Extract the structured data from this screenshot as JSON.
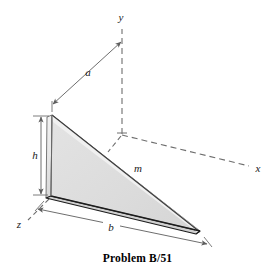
{
  "figure": {
    "caption": "Problem B/51",
    "colors": {
      "plate_fill": "#dedede",
      "plate_fill_light": "#ededed",
      "plate_edge_dark": "#1c1c1c",
      "plate_edge_mid": "#8a8a8a",
      "axis_line": "#6e6e6e",
      "dimension_line": "#6e6e6e",
      "text": "#1a1a1a",
      "background": "#ffffff"
    },
    "axes": [
      {
        "id": "y",
        "label": "y",
        "style": "dashed",
        "label_x": 121,
        "label_y": 21
      },
      {
        "id": "x",
        "label": "x",
        "style": "dashed",
        "label_x": 258,
        "label_y": 172
      },
      {
        "id": "z",
        "label": "z",
        "style": "dashed",
        "label_x": 19,
        "label_y": 228
      }
    ],
    "dimensions": [
      {
        "id": "a",
        "label": "a",
        "label_x": 88,
        "label_y": 76,
        "arrows": "both"
      },
      {
        "id": "h",
        "label": "h",
        "label_x": 36,
        "label_y": 157,
        "arrows": "both"
      },
      {
        "id": "b",
        "label": "b",
        "label_x": 111,
        "label_y": 231,
        "arrows": "both"
      },
      {
        "id": "m",
        "label": "m",
        "label_x": 138,
        "label_y": 172,
        "arrows": "none"
      }
    ],
    "body": {
      "name": "triangular-plate",
      "description": "thin triangular plate of mass m standing vertically in the y-z plane direction"
    }
  }
}
